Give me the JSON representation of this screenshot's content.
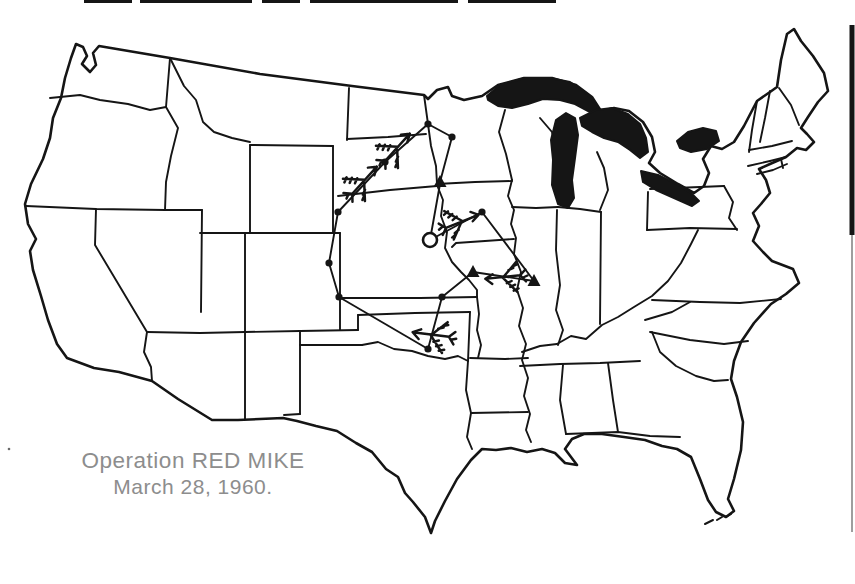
{
  "figure": {
    "type": "historical-operations-map",
    "region": "continental United States"
  },
  "caption": {
    "line1": "Operation RED MIKE",
    "line2": "March 28, 1960.",
    "x": 193,
    "y1": 468,
    "y2": 494,
    "font_size1": 22.5,
    "font_size2": 21
  },
  "colors": {
    "ink": "#151515",
    "caption_grey": "#8d8d8d",
    "paper": "#ffffff",
    "scan_grey": "#6a6a6a"
  },
  "basemap": {
    "outline": "M 76,44 L 83,47 87,56 82,64 90,72 96,65 93,53 99,46 170,58 260,74 352,86 424,95 428,99 437,90 448,87 452,96 464,100 482,96 498,85 524,78 552,78 576,85 592,97 601,111 614,108 629,111 643,122 652,137 655,152 649,163 660,173 678,184 694,193 704,186 709,173 703,159 711,146 722,149 734,142 744,126 757,101 770,92 777,87 781,60 787,34 794,29 801,41 813,56 824,73 828,91 818,102 808,117 801,128 807,134 814,142 806,150 797,148 786,157 770,164 759,169 766,180 770,193 761,204 753,213 759,226 753,241 763,252 772,261 793,269 799,283 786,294 771,304 754,323 741,342 734,361 731,379 737,397 743,422 741,450 734,479 728,499 734,511 726,517 716,512 708,500 700,479 691,457 677,449 662,446 645,440 624,437 602,434 584,434 572,439 565,449 571,457 577,465 565,463 555,453 542,449 527,452 511,448 496,450 482,449 471,460 457,479 445,501 435,521 431,533 425,517 413,502 405,493 398,477 386,469 372,452 356,443 337,431 316,426 297,421 283,418 260,419 238,420 212,420 178,399 152,381 119,372 94,368 67,358 57,344 48,320 41,296 33,270 30,251 36,239 28,224 25,204 31,184 43,159 50,138 53,118 61,98 65,78 71,58 Z",
    "state_lines": [
      "M 50,98 L 80,95 100,100 128,104 150,110 166,107",
      "M 170,58 L 166,107",
      "M 170,58 L 184,86 196,100 203,122 214,132 232,138 250,142",
      "M 166,107 L 178,128 171,156 166,182 165,210",
      "M 26,206 L 96,209 165,210",
      "M 96,209 L 95,245 147,332 144,352 151,367 152,381",
      "M 165,210 L 202,210",
      "M 202,210 L 201,312",
      "M 147,332 L 200,333 245,332",
      "M 200,233 L 250,233",
      "M 245,233 L 245,332",
      "M 250,145 L 333,146",
      "M 250,145 L 250,233",
      "M 333,146 L 333,233",
      "M 250,233 L 333,233",
      "M 349,88 L 347,140",
      "M 347,139 L 388,137 426,134",
      "M 424,95 L 428,124 431,146 436,166 437,184",
      "M 338,196 L 390,190 437,186",
      "M 333,233 L 340,233",
      "M 340,233 L 340,330",
      "M 340,298 L 420,298 477,297",
      "M 245,332 L 300,331 358,330",
      "M 245,332 L 245,419",
      "M 300,331 L 300,414",
      "M 284,415 L 300,414",
      "M 358,315 L 415,313 470,312",
      "M 358,330 L 358,315",
      "M 300,345 L 362,345",
      "M 362,345 L 378,342 394,349 412,351 428,356 445,359 458,356 468,361",
      "M 468,361 L 466,390 471,413",
      "M 471,413 L 467,437 472,449",
      "M 470,312 L 468,361",
      "M 470,358 L 505,359 528,358",
      "M 471,413 L 528,412",
      "M 512,180 L 508,196 514,210 511,224 516,238 514,254 521,272 517,290 523,308 519,326 526,344 522,360 528,378 524,396 530,414 526,430 531,442",
      "M 437,184 L 475,182 512,181",
      "M 456,243 L 452,247 M 456,243 L 485,241 514,239",
      "M 437,185 L 443,200 441,216 447,232 445,248 452,262 461,272 469,280 477,290 477,297",
      "M 477,297 L 479,314 477,330 481,345 478,358",
      "M 505,110 L 499,132 506,154 512,180",
      "M 512,207 L 536,208 558,207",
      "M 557,210 L 556,250 560,285 556,310 563,330 558,345",
      "M 522,352 L 540,346 557,344 571,336 586,339 602,325 618,317 634,307 652,296 668,281 681,263 691,244 698,230",
      "M 601,212 L 600,324",
      "M 558,207 L 580,209 601,212",
      "M 600,210 L 608,190 604,168 597,152",
      "M 540,118 L 552,132 556,148",
      "M 648,192 L 647,230",
      "M 647,230 L 690,228 737,229",
      "M 650,189 L 700,187 724,186",
      "M 724,186 L 733,202 729,218 737,230",
      "M 652,300 L 700,302 740,303 781,299",
      "M 645,320 L 672,312 690,302",
      "M 650,332 L 690,340 724,344 748,341",
      "M 652,332 L 660,352 676,366 696,376 714,381 728,380",
      "M 520,366 L 560,364 600,363 640,361",
      "M 563,365 L 560,400 566,434",
      "M 608,363 L 613,400 618,432",
      "M 566,434 L 618,432 650,436 680,437",
      "M 757,101 L 752,130 749,152",
      "M 770,91 L 765,118 760,142",
      "M 749,150 L 772,146 792,141",
      "M 748,166 L 770,161 786,157",
      "M 779,88 L 791,105 799,125",
      "M 781,159 L 783,168",
      "M 757,174 L 773,170 787,164"
    ],
    "lakes": [
      "M 487,96 L 500,85 525,78 550,78 570,82 585,92 596,104 600,112 590,112 575,104 560,100 543,99 528,104 512,108 498,106 488,100 Z",
      "M 556,120 L 566,113 575,118 578,135 575,158 572,180 574,198 568,208 558,204 552,185 553,160 551,140 Z",
      "M 580,118 L 596,110 612,108 628,114 640,124 646,138 648,152 640,158 630,150 618,142 604,138 592,132 582,126 Z",
      "M 641,171 L 658,175 676,184 691,193 699,201 692,206 674,198 656,190 643,182 Z",
      "M 677,141 L 688,132 703,128 716,131 719,141 707,149 691,152 680,148 Z"
    ],
    "florida_keys_dashes": [
      [
        705,
        524,
        713,
        520
      ],
      [
        717,
        520,
        722,
        517
      ],
      [
        726,
        517,
        731,
        514
      ]
    ],
    "scan_marks": {
      "top_segments": [
        [
          84,
          132
        ],
        [
          140,
          252
        ],
        [
          262,
          300
        ],
        [
          310,
          458
        ],
        [
          468,
          556
        ]
      ],
      "right_bar": {
        "x": 849.5,
        "y": 25,
        "w": 5,
        "h": 210
      },
      "right_thin_line": {
        "x": 852,
        "y1": 235,
        "y2": 532
      },
      "left_speck": {
        "x": 9,
        "y": 449
      }
    }
  },
  "operation": {
    "routes": [
      [
        [
          452,
          137
        ],
        [
          428,
          124
        ]
      ],
      [
        [
          428,
          124
        ],
        [
          385,
          162
        ],
        [
          338,
          212
        ],
        [
          329,
          263
        ],
        [
          339,
          297
        ]
      ],
      [
        [
          339,
          297
        ],
        [
          428,
          349
        ]
      ],
      [
        [
          428,
          349
        ],
        [
          442,
          297
        ],
        [
          473,
          272
        ]
      ],
      [
        [
          473,
          272
        ],
        [
          534,
          281
        ]
      ],
      [
        [
          534,
          281
        ],
        [
          482,
          212
        ]
      ],
      [
        [
          482,
          212
        ],
        [
          430,
          240
        ]
      ],
      [
        [
          452,
          137
        ],
        [
          440,
          182
        ]
      ],
      [
        [
          440,
          184
        ],
        [
          430,
          240
        ]
      ]
    ],
    "waypoint_dots": [
      [
        428,
        124
      ],
      [
        452,
        137
      ],
      [
        385,
        162
      ],
      [
        338,
        212
      ],
      [
        329,
        263
      ],
      [
        339,
        297
      ],
      [
        428,
        349
      ],
      [
        442,
        297
      ],
      [
        482,
        212
      ]
    ],
    "base_triangles": [
      [
        440,
        182
      ],
      [
        473,
        272
      ],
      [
        534,
        281
      ]
    ],
    "command_post_circle": {
      "x": 430,
      "y": 240,
      "r": 7
    },
    "aircraft_glyph": "M -16,2 L 13,-2 M 13,-2 L 7,-6 M 13,-2 L 7,2 M -1,0 L -14,-12 M -2,0 L -12,13 M -16,2 L -21,-3 M -16,2 L -20,7 M -5,-5 L -9,-3 M -8,-8 L -12,-6 M -11,-11 L -15,-9 M -6,6 L -10,8 M -9,9 L -13,11 M -18,0 L -22,2",
    "aircraft": [
      {
        "name": "bomber-south-dakota-north",
        "x": 399,
        "y": 146,
        "rot": -40,
        "scale": 1.25
      },
      {
        "name": "bomber-south-dakota-south",
        "x": 366,
        "y": 179,
        "rot": -40,
        "scale": 1.25
      },
      {
        "name": "bomber-iowa",
        "x": 464,
        "y": 221,
        "rot": -14,
        "scale": 1.2
      },
      {
        "name": "bomber-missouri",
        "x": 501,
        "y": 277,
        "rot": 182,
        "scale": 1.2
      },
      {
        "name": "bomber-oklahoma",
        "x": 429,
        "y": 334,
        "rot": 195,
        "scale": 1.25
      }
    ]
  }
}
